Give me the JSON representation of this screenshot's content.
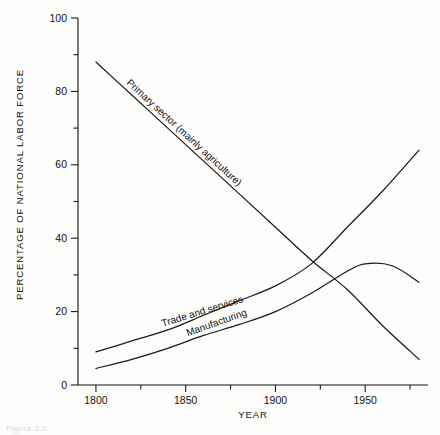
{
  "chart_data": {
    "type": "line",
    "title": "",
    "xlabel": "YEAR",
    "ylabel": "PERCENTAGE OF NATIONAL LABOR FORCE",
    "xlim": [
      1790,
      1985
    ],
    "ylim": [
      0,
      100
    ],
    "grid": false,
    "legend_position": "inline-labels",
    "xticks": [
      1800,
      1850,
      1900,
      1950
    ],
    "xtick_labels": [
      "1800",
      "1850",
      "1900",
      "1950"
    ],
    "xminor_ticks": [
      1825,
      1875,
      1925,
      1975
    ],
    "yticks": [
      0,
      20,
      40,
      60,
      80,
      100
    ],
    "ytick_labels": [
      "0",
      "20",
      "40",
      "60",
      "80",
      "100"
    ],
    "yminor_ticks": [
      10,
      30,
      50,
      70,
      90
    ],
    "series": [
      {
        "name": "Primary sector (mainly agriculture)",
        "label": "Primary sector (mainly agriculture)",
        "x": [
          1800,
          1820,
          1840,
          1860,
          1880,
          1900,
          1920,
          1940,
          1960,
          1980
        ],
        "values": [
          88,
          79,
          70,
          61,
          52,
          43,
          34,
          26,
          16,
          7
        ]
      },
      {
        "name": "Trade and services",
        "label": "Trade and services",
        "x": [
          1800,
          1820,
          1840,
          1860,
          1880,
          1900,
          1920,
          1940,
          1960,
          1980
        ],
        "values": [
          9,
          12,
          15,
          19,
          23,
          27,
          33,
          43,
          53,
          64
        ]
      },
      {
        "name": "Manufacturing",
        "label": "Manufacturing",
        "x": [
          1800,
          1820,
          1840,
          1860,
          1880,
          1900,
          1920,
          1940,
          1950,
          1965,
          1980
        ],
        "values": [
          4.5,
          7,
          10,
          13.5,
          16.5,
          20,
          25,
          31,
          33,
          32.5,
          28
        ]
      }
    ]
  },
  "caption": {
    "text": "Figure 2.2"
  }
}
